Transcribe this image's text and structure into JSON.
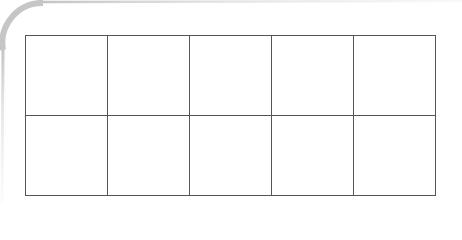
{
  "diagram": {
    "type": "empty-grid",
    "rows": 2,
    "columns": 5,
    "cells": [
      [
        "",
        "",
        "",
        "",
        ""
      ],
      [
        "",
        "",
        "",
        "",
        ""
      ]
    ],
    "colors": {
      "grid_line": "#555555",
      "frame_border": "#c8c8c8",
      "background": "#ffffff"
    }
  }
}
